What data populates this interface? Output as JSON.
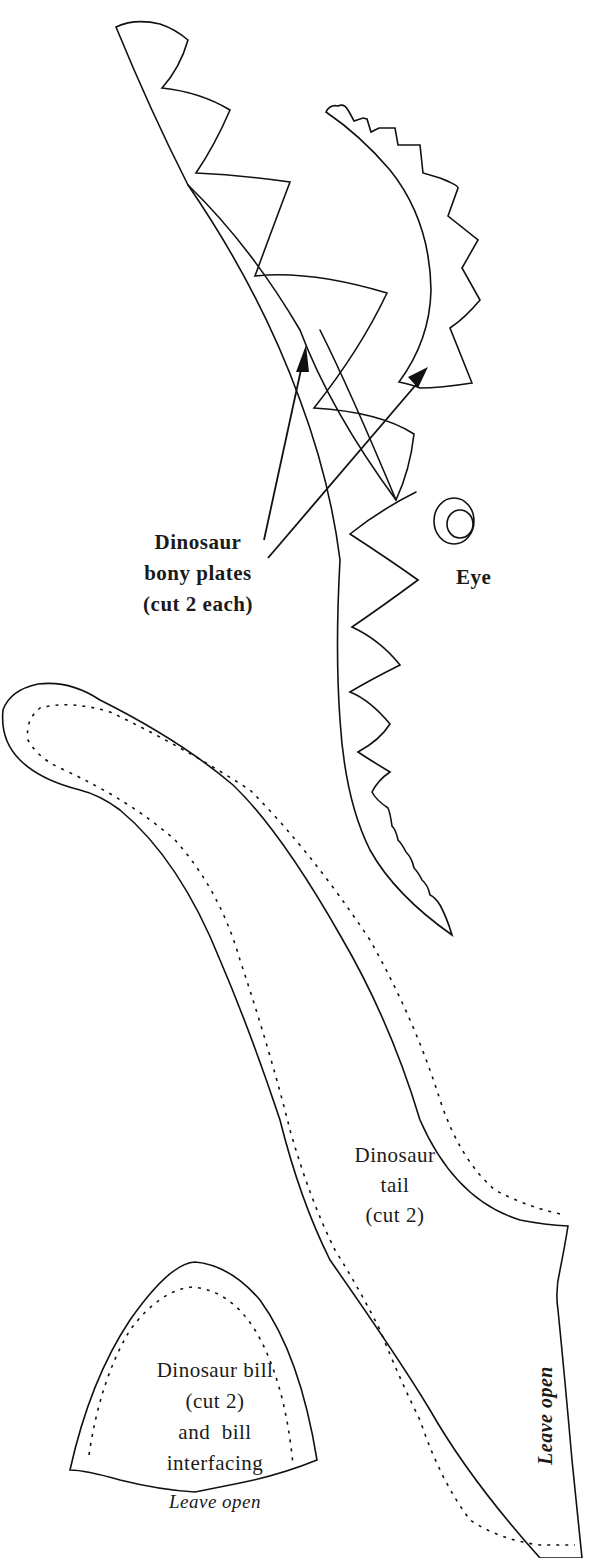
{
  "figure": {
    "type": "sewing-pattern",
    "stroke_color": "#111111",
    "background_color": "#ffffff"
  },
  "pieces": {
    "bony_plates": {
      "label_lines": [
        "Dinosaur",
        "bony plates",
        "(cut 2 each)"
      ],
      "count": 2
    },
    "eye": {
      "label": "Eye"
    },
    "tail": {
      "label_lines": [
        "Dinosaur",
        "tail",
        "(cut 2)"
      ],
      "leave_open": "Leave open"
    },
    "bill": {
      "label_lines": [
        "Dinosaur bill",
        "(cut 2)",
        "and  bill",
        "interfacing"
      ],
      "leave_open": "Leave open"
    }
  }
}
